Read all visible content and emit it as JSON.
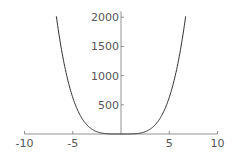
{
  "chart_data": {
    "type": "line",
    "title": "",
    "xlabel": "",
    "ylabel": "",
    "function": "x^4",
    "xlim": [
      -10,
      10
    ],
    "ylim": [
      0,
      2100
    ],
    "grid": false,
    "legend": null,
    "x_ticks": [
      "-10",
      "-5",
      "5",
      "10"
    ],
    "y_ticks": [
      "500",
      "1000",
      "1500",
      "2000"
    ],
    "series": [
      {
        "name": "curve",
        "x": [
          -6.7,
          -6,
          -5,
          -4,
          -3,
          -2,
          -1,
          0,
          1,
          2,
          3,
          4,
          5,
          6,
          6.7
        ],
        "y": [
          2015,
          1296,
          625,
          256,
          81,
          16,
          1,
          0,
          1,
          16,
          81,
          256,
          625,
          1296,
          2015
        ]
      }
    ],
    "color": "#333333"
  }
}
